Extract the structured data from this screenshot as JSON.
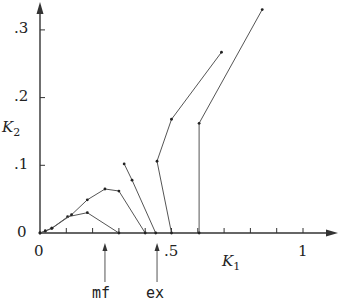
{
  "chart_data": {
    "type": "line",
    "title": "",
    "xlabel": "K1",
    "ylabel": "K2",
    "xlim": [
      0,
      1.12
    ],
    "ylim": [
      0,
      0.34
    ],
    "grid": false,
    "legend": null,
    "x_ticks": [
      0,
      0.1,
      0.2,
      0.3,
      0.4,
      0.5,
      0.6,
      0.7,
      0.8,
      0.9,
      1.0
    ],
    "x_tick_labels": [
      {
        "value": 0,
        "label": "0"
      },
      {
        "value": 0.5,
        "label": ".5"
      },
      {
        "value": 1,
        "label": "1"
      }
    ],
    "y_ticks": [
      0,
      0.1,
      0.2,
      0.3
    ],
    "y_tick_labels": [
      {
        "value": 0,
        "label": "0"
      },
      {
        "value": 0.1,
        "label": ".1"
      },
      {
        "value": 0.2,
        "label": ".2"
      },
      {
        "value": 0.3,
        "label": ".3"
      }
    ],
    "series": [
      {
        "name": "curve-1-lower",
        "points": [
          [
            0,
            0
          ],
          [
            0.02,
            0.003
          ],
          [
            0.045,
            0.007
          ],
          [
            0.105,
            0.024
          ],
          [
            0.18,
            0.03
          ],
          [
            0.3,
            0
          ]
        ]
      },
      {
        "name": "curve-2-upper",
        "points": [
          [
            0,
            0
          ],
          [
            0.02,
            0.003
          ],
          [
            0.045,
            0.007
          ],
          [
            0.12,
            0.027
          ],
          [
            0.18,
            0.049
          ],
          [
            0.247,
            0.065
          ],
          [
            0.3,
            0.062
          ],
          [
            0.4,
            0
          ]
        ]
      },
      {
        "name": "curve-3",
        "points": [
          [
            0.32,
            0.102
          ],
          [
            0.35,
            0.078
          ],
          [
            0.44,
            0
          ]
        ]
      },
      {
        "name": "curve-4",
        "points": [
          [
            0.5,
            0
          ],
          [
            0.445,
            0.106
          ],
          [
            0.5,
            0.168
          ],
          [
            0.69,
            0.267
          ]
        ]
      },
      {
        "name": "curve-5",
        "points": [
          [
            0.605,
            0
          ],
          [
            0.605,
            0.162
          ],
          [
            0.845,
            0.33
          ]
        ]
      }
    ],
    "annotations": [
      {
        "label": "mf",
        "x": 0.247,
        "type": "arrow-up-below-axis"
      },
      {
        "label": "ex",
        "x": 0.445,
        "type": "arrow-up-below-axis"
      }
    ]
  },
  "labels": {
    "x_axis": "K",
    "x_axis_sub": "1",
    "y_axis": "K",
    "y_axis_sub": "2",
    "xt0": "0",
    "xt5": ".5",
    "xt10": "1",
    "yt0": "0",
    "yt1": ".1",
    "yt2": ".2",
    "yt3": ".3",
    "mf": "mf",
    "ex": "ex"
  },
  "colors": {
    "axis": "#333333",
    "line": "#555555",
    "marker": "#222222"
  }
}
